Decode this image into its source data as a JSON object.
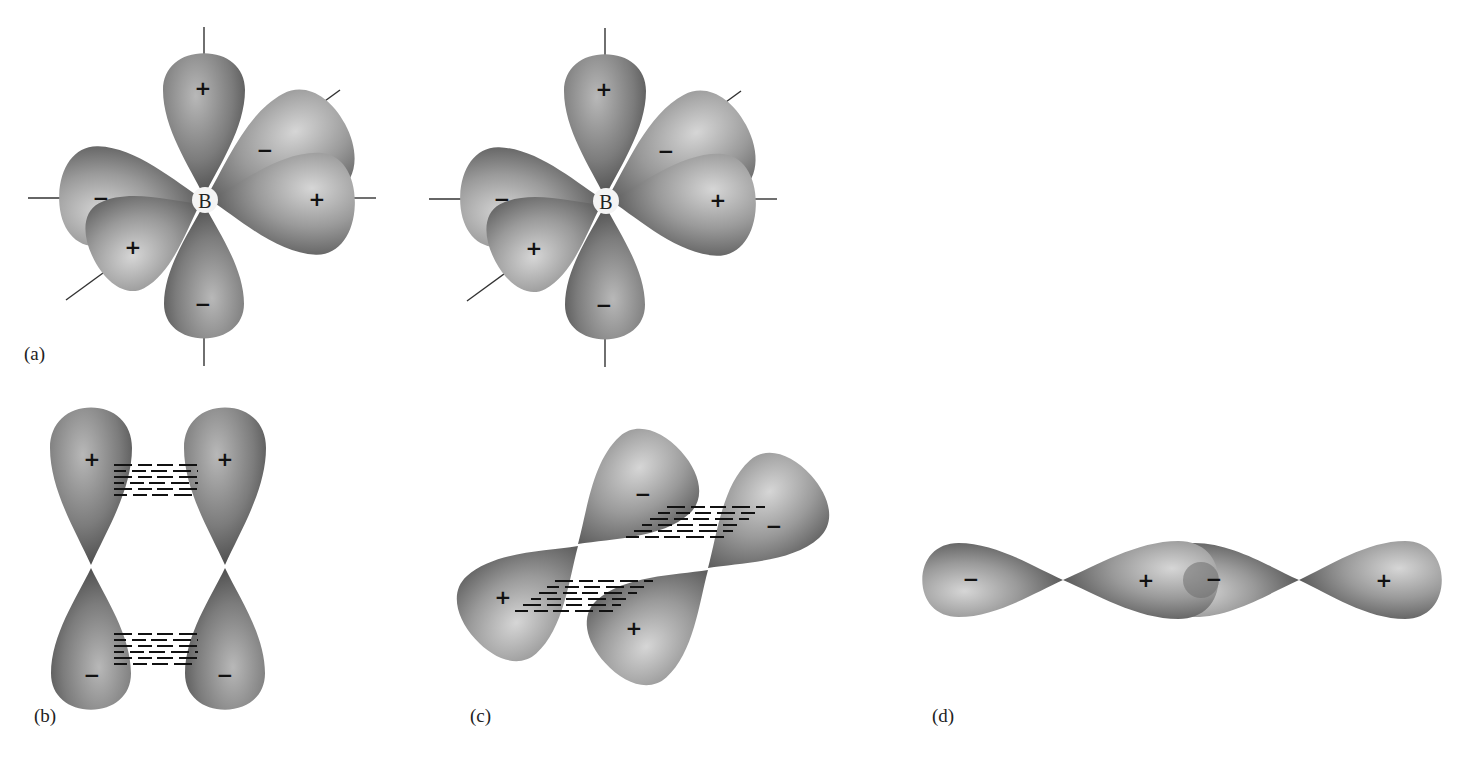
{
  "figure": {
    "colors": {
      "background": "#ffffff",
      "lobe_light": "#d4d4d4",
      "lobe_mid": "#8c8c8c",
      "lobe_dark": "#3a3a3a",
      "axis_line": "#333333",
      "text": "#222222"
    }
  },
  "panels": {
    "a": {
      "label": "(a)",
      "structures": [
        {
          "atom": "B",
          "lobes": [
            {
              "position": "top",
              "sign": "+"
            },
            {
              "position": "bottom",
              "sign": "−"
            },
            {
              "position": "right",
              "sign": "+"
            },
            {
              "position": "left",
              "sign": "−"
            },
            {
              "position": "back-right",
              "sign": "−"
            },
            {
              "position": "front-left",
              "sign": "+"
            }
          ]
        },
        {
          "atom": "B",
          "lobes": [
            {
              "position": "top",
              "sign": "+"
            },
            {
              "position": "bottom",
              "sign": "−"
            },
            {
              "position": "right",
              "sign": "+"
            },
            {
              "position": "left",
              "sign": "−"
            },
            {
              "position": "back-right",
              "sign": "−"
            },
            {
              "position": "front-left",
              "sign": "+"
            }
          ]
        }
      ]
    },
    "b": {
      "label": "(b)",
      "type": "side-by-side pi overlap",
      "lobes": [
        {
          "position": "top-left",
          "sign": "+"
        },
        {
          "position": "top-right",
          "sign": "+"
        },
        {
          "position": "bottom-left",
          "sign": "−"
        },
        {
          "position": "bottom-right",
          "sign": "−"
        }
      ]
    },
    "c": {
      "label": "(c)",
      "type": "tilted pi overlap",
      "lobes": [
        {
          "position": "upper-center",
          "sign": "−"
        },
        {
          "position": "upper-right",
          "sign": "−"
        },
        {
          "position": "lower-left",
          "sign": "+"
        },
        {
          "position": "lower-center",
          "sign": "+"
        }
      ]
    },
    "d": {
      "label": "(d)",
      "type": "end-on sigma overlap",
      "lobes": [
        {
          "position": "far-left",
          "sign": "−"
        },
        {
          "position": "center-left",
          "sign": "+"
        },
        {
          "position": "center-right",
          "sign": "−"
        },
        {
          "position": "far-right",
          "sign": "+"
        }
      ]
    }
  }
}
